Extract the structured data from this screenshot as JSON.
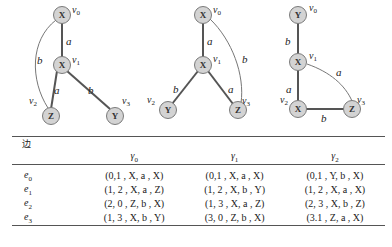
{
  "graphs": [
    {
      "name": "gamma0",
      "nodes": [
        {
          "id": "v0",
          "label": "X",
          "x": 62,
          "y": 15
        },
        {
          "id": "v1",
          "label": "X",
          "x": 62,
          "y": 65
        },
        {
          "id": "v2",
          "label": "Z",
          "x": 48,
          "y": 116
        },
        {
          "id": "v3",
          "label": "Y",
          "x": 115,
          "y": 116
        }
      ],
      "edges": [
        {
          "from": "v0",
          "to": "v1",
          "label": "a"
        },
        {
          "from": "v1",
          "to": "v2",
          "label": "a"
        },
        {
          "from": "v1",
          "to": "v3",
          "label": "b"
        },
        {
          "from": "v2",
          "to": "v0",
          "label": "b",
          "curved": true
        }
      ]
    },
    {
      "name": "gamma1",
      "nodes": [
        {
          "id": "v0",
          "label": "X",
          "x": 203,
          "y": 15
        },
        {
          "id": "v1",
          "label": "X",
          "x": 203,
          "y": 65
        },
        {
          "id": "v2",
          "label": "Y",
          "x": 168,
          "y": 110
        },
        {
          "id": "v3",
          "label": "Z",
          "x": 238,
          "y": 110
        }
      ],
      "edges": [
        {
          "from": "v0",
          "to": "v1",
          "label": "a"
        },
        {
          "from": "v1",
          "to": "v2",
          "label": "b"
        },
        {
          "from": "v1",
          "to": "v3",
          "label": "a"
        },
        {
          "from": "v3",
          "to": "v0",
          "label": "b",
          "curved": true
        }
      ]
    },
    {
      "name": "gamma2",
      "nodes": [
        {
          "id": "v0",
          "label": "Y",
          "x": 298,
          "y": 15
        },
        {
          "id": "v1",
          "label": "X",
          "x": 298,
          "y": 62
        },
        {
          "id": "v2",
          "label": "X",
          "x": 298,
          "y": 109
        },
        {
          "id": "v3",
          "label": "Z",
          "x": 352,
          "y": 109
        }
      ],
      "edges": [
        {
          "from": "v0",
          "to": "v1",
          "label": "b"
        },
        {
          "from": "v1",
          "to": "v2",
          "label": "a"
        },
        {
          "from": "v2",
          "to": "v3",
          "label": "b"
        },
        {
          "from": "v1",
          "to": "v3",
          "label": "a",
          "curved": true
        }
      ]
    }
  ],
  "table": {
    "header_edge": "边",
    "columns": [
      "γ0",
      "γ1",
      "γ2"
    ],
    "column_base": "γ",
    "column_subs": [
      "0",
      "1",
      "2"
    ],
    "rows": [
      {
        "edge": "e",
        "sub": "0",
        "cells": [
          "(0,1 , X, a , X)",
          "(0,1 , X, a , X)",
          "(0,1 , Y, b , X)"
        ]
      },
      {
        "edge": "e",
        "sub": "1",
        "cells": [
          "(1, 2 , X, a , Z)",
          "(1, 2 , X, b , Y)",
          "(1, 2 , X, a , X)"
        ]
      },
      {
        "edge": "e",
        "sub": "2",
        "cells": [
          "(2, 0 , Z, b , X)",
          "(1, 3 , X, a , Z)",
          "(2, 3 , X, b , Z)"
        ]
      },
      {
        "edge": "e",
        "sub": "3",
        "cells": [
          "(1, 3 , X, b , Y)",
          "(3, 0 , Z, b , X)",
          "(3.1 , Z, a , X)"
        ]
      }
    ]
  }
}
